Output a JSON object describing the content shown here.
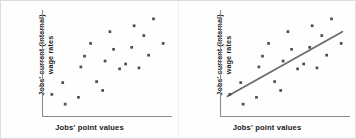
{
  "figure": {
    "background_color": "#fefefe",
    "border_color": "#dcdcdc"
  },
  "panels": [
    {
      "name": "scatter-without-trendline",
      "ylabel_line1": "Jobs' current (internal)",
      "ylabel_line2": "wage rates",
      "xlabel": "Jobs' point values",
      "has_trendline": false
    },
    {
      "name": "scatter-with-trendline",
      "ylabel_line1": "Jobs' current (internal)",
      "ylabel_line2": "wage rates",
      "xlabel": "Jobs' point values",
      "has_trendline": true
    }
  ],
  "colors": {
    "point": "#4d4d4d",
    "axis": "#8d8d8d",
    "trendline": "#6a6a6a",
    "text": "#1a1a1a"
  },
  "chart_data": [
    {
      "type": "scatter",
      "title": "",
      "xlabel": "Jobs' point values",
      "ylabel": "Jobs' current (internal) wage rates",
      "xlim": [
        0,
        100
      ],
      "ylim": [
        0,
        100
      ],
      "grid": false,
      "legend": "none",
      "axis_ticks": false,
      "trendline": null,
      "points": [
        {
          "x": 4,
          "y": 18
        },
        {
          "x": 13,
          "y": 30
        },
        {
          "x": 15,
          "y": 8
        },
        {
          "x": 26,
          "y": 15
        },
        {
          "x": 28,
          "y": 46
        },
        {
          "x": 31,
          "y": 57
        },
        {
          "x": 36,
          "y": 70
        },
        {
          "x": 41,
          "y": 31
        },
        {
          "x": 46,
          "y": 22
        },
        {
          "x": 48,
          "y": 52
        },
        {
          "x": 52,
          "y": 82
        },
        {
          "x": 55,
          "y": 64
        },
        {
          "x": 60,
          "y": 44
        },
        {
          "x": 65,
          "y": 49
        },
        {
          "x": 70,
          "y": 66
        },
        {
          "x": 72,
          "y": 88
        },
        {
          "x": 76,
          "y": 45
        },
        {
          "x": 80,
          "y": 78
        },
        {
          "x": 84,
          "y": 58
        },
        {
          "x": 88,
          "y": 95
        },
        {
          "x": 96,
          "y": 70
        }
      ]
    },
    {
      "type": "scatter",
      "title": "",
      "xlabel": "Jobs' point values",
      "ylabel": "Jobs' current (internal) wage rates",
      "xlim": [
        0,
        100
      ],
      "ylim": [
        0,
        100
      ],
      "grid": false,
      "legend": "none",
      "axis_ticks": false,
      "trendline": {
        "label": "regression line",
        "x_start": 2,
        "y_start": 16,
        "x_end": 97,
        "y_end": 82
      },
      "points": [
        {
          "x": 4,
          "y": 18
        },
        {
          "x": 13,
          "y": 30
        },
        {
          "x": 15,
          "y": 8
        },
        {
          "x": 26,
          "y": 15
        },
        {
          "x": 28,
          "y": 46
        },
        {
          "x": 31,
          "y": 57
        },
        {
          "x": 36,
          "y": 70
        },
        {
          "x": 41,
          "y": 31
        },
        {
          "x": 46,
          "y": 22
        },
        {
          "x": 48,
          "y": 52
        },
        {
          "x": 52,
          "y": 82
        },
        {
          "x": 55,
          "y": 64
        },
        {
          "x": 60,
          "y": 44
        },
        {
          "x": 65,
          "y": 49
        },
        {
          "x": 70,
          "y": 66
        },
        {
          "x": 72,
          "y": 88
        },
        {
          "x": 76,
          "y": 45
        },
        {
          "x": 80,
          "y": 78
        },
        {
          "x": 84,
          "y": 58
        },
        {
          "x": 88,
          "y": 95
        },
        {
          "x": 96,
          "y": 70
        }
      ]
    }
  ]
}
